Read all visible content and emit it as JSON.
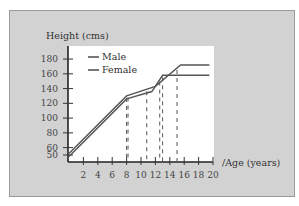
{
  "chart_data": {
    "type": "line",
    "title": "",
    "xlabel": "Age (years)",
    "ylabel": "Height (cms)",
    "xlim": [
      0,
      20
    ],
    "ylim": [
      45,
      185
    ],
    "x_ticks": [
      2,
      4,
      6,
      8,
      10,
      12,
      14,
      16,
      18,
      20
    ],
    "y_ticks": [
      50,
      60,
      80,
      100,
      120,
      140,
      160,
      180
    ],
    "grid": false,
    "legend_position": "top-left inside plot",
    "series": [
      {
        "name": "Male",
        "x": [
          0,
          8,
          12,
          15.5,
          19.5
        ],
        "y": [
          52,
          130,
          143,
          172,
          172
        ]
      },
      {
        "name": "Female",
        "x": [
          0,
          8,
          11.5,
          13,
          19.5
        ],
        "y": [
          48,
          126,
          136,
          158,
          158
        ]
      }
    ],
    "annotations": {
      "dashed_verticals_at_age": [
        8,
        8.2,
        10.8,
        12.6,
        13,
        15
      ]
    }
  },
  "labels": {
    "ylabel": "Height (cms)",
    "xlabel": "/Age (years)",
    "legend_male": "Male",
    "legend_female": "Female"
  },
  "colors": {
    "panel": "#d2d2d2",
    "plot_bg": "#ffffff",
    "line": "#555555"
  }
}
